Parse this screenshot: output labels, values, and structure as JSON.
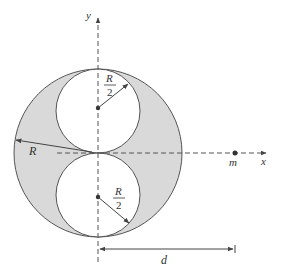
{
  "diagram": {
    "colors": {
      "shaded": "#d9d9d9",
      "stroke": "#555555",
      "axis": "#555555"
    },
    "labels": {
      "y_axis": "y",
      "x_axis": "x",
      "big_radius": "R",
      "small_radius_top_num": "R",
      "small_radius_top_den": "2",
      "small_radius_bottom_num": "R",
      "small_radius_bottom_den": "2",
      "mass": "m",
      "distance": "d"
    }
  }
}
